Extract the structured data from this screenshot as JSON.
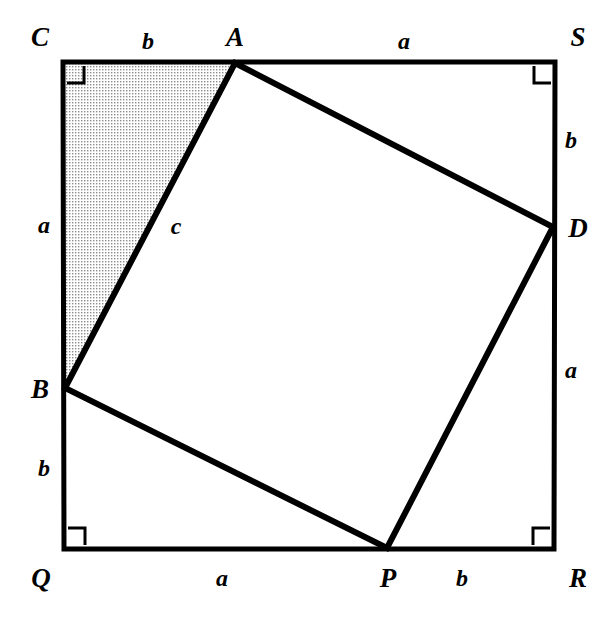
{
  "figure": {
    "type": "geometry-diagram",
    "canvas": {
      "width": 607,
      "height": 618
    },
    "colors": {
      "stroke": "#000000",
      "background": "#ffffff",
      "shaded_fill": "#d9d9d9",
      "inner_fill": "#ffffff"
    },
    "outer_square": {
      "name": "CSRQ",
      "vertices": [
        {
          "id": "C",
          "x": 63,
          "y": 62
        },
        {
          "id": "S",
          "x": 555,
          "y": 62
        },
        {
          "id": "R",
          "x": 554,
          "y": 549
        },
        {
          "id": "Q",
          "x": 64,
          "y": 549
        }
      ],
      "stroke_width": 5
    },
    "inner_square": {
      "name": "ADPB",
      "vertices": [
        {
          "id": "A",
          "x": 235,
          "y": 63
        },
        {
          "id": "D",
          "x": 553,
          "y": 227
        },
        {
          "id": "P",
          "x": 387,
          "y": 548
        },
        {
          "id": "B",
          "x": 65,
          "y": 388
        }
      ],
      "stroke_width": 6
    },
    "shaded_triangle": {
      "name": "CAB",
      "vertices": [
        {
          "id": "C",
          "x": 63,
          "y": 62
        },
        {
          "id": "A",
          "x": 235,
          "y": 63
        },
        {
          "id": "B",
          "x": 65,
          "y": 388
        }
      ]
    },
    "right_angle_markers": [
      {
        "at": "C",
        "x": 63,
        "y": 62,
        "dx": 1,
        "dy": 1,
        "size": 17
      },
      {
        "at": "S",
        "x": 555,
        "y": 62,
        "dx": -1,
        "dy": 1,
        "size": 17
      },
      {
        "at": "R",
        "x": 554,
        "y": 549,
        "dx": -1,
        "dy": -1,
        "size": 17
      },
      {
        "at": "Q",
        "x": 64,
        "y": 549,
        "dx": 1,
        "dy": -1,
        "size": 17
      }
    ],
    "vertex_labels": [
      {
        "id": "vertex-C",
        "text": "C",
        "x": 40,
        "y": 37
      },
      {
        "id": "vertex-A",
        "text": "A",
        "x": 235,
        "y": 37
      },
      {
        "id": "vertex-S",
        "text": "S",
        "x": 578,
        "y": 37
      },
      {
        "id": "vertex-D",
        "text": "D",
        "x": 578,
        "y": 228
      },
      {
        "id": "vertex-B",
        "text": "B",
        "x": 40,
        "y": 389
      },
      {
        "id": "vertex-Q",
        "text": "Q",
        "x": 41,
        "y": 578
      },
      {
        "id": "vertex-P",
        "text": "P",
        "x": 388,
        "y": 578
      },
      {
        "id": "vertex-R",
        "text": "R",
        "x": 578,
        "y": 578
      }
    ],
    "side_labels": [
      {
        "id": "side-top-b",
        "text": "b",
        "x": 148,
        "y": 41,
        "segment": "C-A"
      },
      {
        "id": "side-top-a",
        "text": "a",
        "x": 404,
        "y": 41,
        "segment": "A-S"
      },
      {
        "id": "side-right-b",
        "text": "b",
        "x": 571,
        "y": 140,
        "segment": "S-D"
      },
      {
        "id": "side-right-a",
        "text": "a",
        "x": 571,
        "y": 370,
        "segment": "D-R"
      },
      {
        "id": "side-bottom-b",
        "text": "b",
        "x": 462,
        "y": 578,
        "segment": "P-R"
      },
      {
        "id": "side-bottom-a",
        "text": "a",
        "x": 222,
        "y": 578,
        "segment": "Q-P"
      },
      {
        "id": "side-left-b",
        "text": "b",
        "x": 44,
        "y": 468,
        "segment": "B-Q"
      },
      {
        "id": "side-left-a",
        "text": "a",
        "x": 44,
        "y": 225,
        "segment": "C-B"
      },
      {
        "id": "side-hypotenuse-c",
        "text": "c",
        "x": 176,
        "y": 226,
        "segment": "A-B"
      }
    ]
  }
}
